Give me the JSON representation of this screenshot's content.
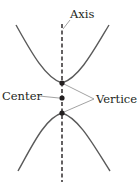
{
  "diagram": {
    "labels": {
      "axis": "Axis",
      "center": "Center",
      "vertices": "Vertices"
    },
    "colors": {
      "curve": "#5a5a5a",
      "axis": "#231f20",
      "point": "#231f20",
      "leader": "#8a8a8a",
      "text": "#231f20"
    },
    "points": {
      "upper_vertex": {
        "x": 62,
        "y": 83
      },
      "center": {
        "x": 62,
        "y": 98
      },
      "lower_vertex": {
        "x": 62,
        "y": 113
      }
    }
  }
}
